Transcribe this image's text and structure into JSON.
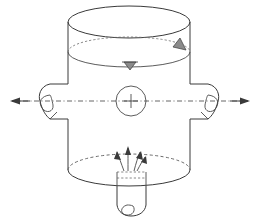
{
  "figure": {
    "kind": "engineering-line-drawing",
    "background_color": "#ffffff",
    "line_color": "#3a3a3a",
    "dash_color": "#5a5a5a",
    "canvas": {
      "width": 260,
      "height": 223
    }
  },
  "vessel": {
    "name": "cylindrical-shell",
    "left_wall_x": 68,
    "right_wall_x": 190,
    "top_y": 22,
    "bottom_y": 185,
    "rim_ellipse": {
      "cx": 129,
      "cy": 22,
      "rx": 61,
      "ry": 16
    },
    "liquid_level_ellipse": {
      "cx": 129,
      "cy": 52,
      "rx": 61,
      "ry": 15
    },
    "bottom_ellipse": {
      "cx": 129,
      "cy": 170,
      "rx": 61,
      "ry": 16
    }
  },
  "center_mark": {
    "name": "center-axis-mark",
    "cx": 131,
    "cy": 101,
    "r": 15,
    "cross_length": 13
  },
  "centerline": {
    "name": "horizontal-centerline",
    "y": 101,
    "x_start": 10,
    "x_end": 250,
    "style": "dash-dot"
  },
  "nozzles": [
    {
      "name": "left-side-nozzle",
      "side": "left",
      "x_outer": 43,
      "x_inner": 68,
      "y_top": 84,
      "y_bottom": 119,
      "flow_arrow": {
        "direction": "left",
        "tip_x": 10,
        "tail_x": 60,
        "y": 101
      }
    },
    {
      "name": "right-side-nozzle",
      "side": "right",
      "x_outer": 215,
      "x_inner": 190,
      "y_top": 84,
      "y_bottom": 119,
      "flow_arrow": {
        "direction": "right",
        "tip_x": 250,
        "tail_x": 200,
        "y": 101
      }
    },
    {
      "name": "bottom-outlet-nozzle",
      "side": "bottom",
      "x_left": 117,
      "x_right": 146,
      "y_top": 175,
      "y_bottom": 212
    }
  ],
  "sparger": {
    "name": "bottom-sparger",
    "body": {
      "x": 117,
      "y": 172,
      "width": 29,
      "height": 14
    },
    "jet_arrows": [
      {
        "name": "jet-arrow-1",
        "x1": 124,
        "y1": 171,
        "x2": 117,
        "y2": 152
      },
      {
        "name": "jet-arrow-2",
        "x1": 128,
        "y1": 171,
        "x2": 128,
        "y2": 148
      },
      {
        "name": "jet-arrow-3",
        "x1": 134,
        "y1": 171,
        "x2": 140,
        "y2": 152
      },
      {
        "name": "jet-arrow-4",
        "x1": 137,
        "y1": 171,
        "x2": 145,
        "y2": 157
      }
    ]
  },
  "level_markers": [
    {
      "name": "level-marker-front",
      "x": 130,
      "y": 63,
      "orientation": "down"
    },
    {
      "name": "level-marker-right",
      "x": 176,
      "y": 44,
      "orientation": "down-left"
    }
  ],
  "labels": {
    "has_text_labels": false,
    "visible_text": ""
  }
}
